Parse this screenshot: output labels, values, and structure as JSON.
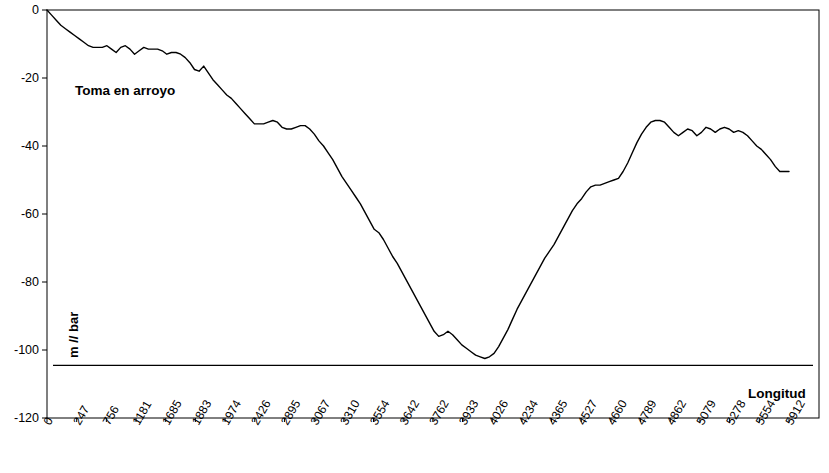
{
  "chart_data": {
    "type": "line",
    "title": "",
    "annotations": [
      {
        "name": "series-annotation",
        "text": "Toma en arroyo"
      },
      {
        "name": "axis-annotation",
        "text": "Longitud"
      }
    ],
    "ylabel": "m // bar",
    "xlabel": "Longitud",
    "ylim": [
      -120,
      0
    ],
    "yticks": [
      0,
      -20,
      -40,
      -60,
      -80,
      -100,
      -120
    ],
    "ytick_labels": [
      "0",
      "-20",
      "-40",
      "-60",
      "-80",
      "-100",
      "-120"
    ],
    "grid": false,
    "legend": "none",
    "xtick_labels": [
      "0",
      "247",
      "756",
      "1181",
      "1685",
      "1883",
      "1974",
      "2426",
      "2895",
      "3067",
      "3310",
      "3554",
      "3642",
      "3762",
      "3933",
      "4026",
      "4234",
      "4365",
      "4527",
      "4660",
      "4789",
      "4862",
      "5079",
      "5278",
      "5554",
      "5912"
    ],
    "series": [
      {
        "name": "perfil",
        "color": "#000000",
        "values": [
          0,
          -1.5,
          -3,
          -4.5,
          -5.5,
          -6.5,
          -7.5,
          -8.5,
          -9.5,
          -10.5,
          -11,
          -11,
          -11,
          -10.5,
          -11.5,
          -12.5,
          -11,
          -10.5,
          -11.5,
          -13,
          -12,
          -11,
          -11.5,
          -11.5,
          -11.5,
          -12,
          -13,
          -12.5,
          -12.5,
          -13,
          -14,
          -15.5,
          -17.5,
          -18,
          -16.5,
          -18.5,
          -20.5,
          -22,
          -23.5,
          -25,
          -26,
          -27.5,
          -29,
          -30.5,
          -32,
          -33.5,
          -33.5,
          -33.5,
          -33,
          -32.5,
          -33,
          -34.5,
          -35,
          -35,
          -34.5,
          -34,
          -34,
          -35,
          -36.5,
          -38.5,
          -40,
          -42,
          -44,
          -46.5,
          -49,
          -51,
          -53,
          -55,
          -57,
          -59.5,
          -62,
          -64.5,
          -65.5,
          -67.5,
          -70,
          -72.5,
          -74.5,
          -77,
          -79.5,
          -82,
          -84.5,
          -87,
          -89.5,
          -92,
          -94.5,
          -96,
          -95.5,
          -94.5,
          -95.5,
          -97,
          -98.5,
          -99.5,
          -100.5,
          -101.5,
          -102,
          -102.5,
          -102,
          -101,
          -99,
          -96.5,
          -94,
          -91,
          -88,
          -85.5,
          -83,
          -80.5,
          -78,
          -75.5,
          -73,
          -71,
          -69,
          -66.5,
          -64,
          -61.5,
          -59,
          -57,
          -55.5,
          -53.5,
          -52,
          -51.5,
          -51.5,
          -51,
          -50.5,
          -50,
          -49.5,
          -47.5,
          -45,
          -42,
          -39,
          -36.5,
          -34.5,
          -33,
          -32.5,
          -32.5,
          -33,
          -34.5,
          -36,
          -37,
          -36,
          -35,
          -35.5,
          -37,
          -36,
          -34.5,
          -35,
          -36,
          -35,
          -34.5,
          -35,
          -36,
          -35.5,
          -36,
          -37,
          -38.5,
          -40,
          -41,
          -42.5,
          -44,
          -46,
          -47.5,
          -47.5,
          -47.5
        ]
      }
    ],
    "baseline": {
      "name": "bottom-rule",
      "y": -104.5
    }
  },
  "chart_axis": {
    "x_axis_name": "x-axis",
    "y_axis_name": "y-axis"
  }
}
